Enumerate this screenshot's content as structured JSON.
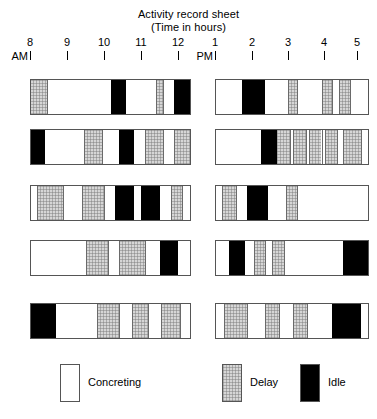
{
  "title": {
    "line1": "Activity record sheet",
    "line2": "(Time in hours)"
  },
  "axis": {
    "am_label": "AM",
    "pm_label": "PM",
    "am_ticks": [
      "8",
      "9",
      "10",
      "11",
      "12"
    ],
    "pm_ticks": [
      "1",
      "2",
      "3",
      "4",
      "5"
    ]
  },
  "legend": {
    "items": [
      {
        "label": "Concreting",
        "kind": "concreting",
        "color": "#ffffff"
      },
      {
        "label": "Delay",
        "kind": "delay",
        "color": "#d6d6d6"
      },
      {
        "label": "Idle",
        "kind": "idle",
        "color": "#000000"
      }
    ]
  },
  "chart_data": {
    "type": "bar",
    "title": "Activity record sheet",
    "subtitle": "(Time in hours)",
    "xlabel": "Time in hours",
    "ylabel": "",
    "grid": false,
    "legend_position": "bottom",
    "categories": [
      "Row 1",
      "Row 2",
      "Row 3",
      "Row 4",
      "Row 5"
    ],
    "activity_types": [
      "Concreting",
      "Delay",
      "Idle"
    ],
    "am_range": [
      8,
      12
    ],
    "pm_range": [
      13,
      17
    ],
    "am_tick_labels": [
      "8",
      "9",
      "10",
      "11",
      "12"
    ],
    "pm_tick_labels": [
      "1",
      "2",
      "3",
      "4",
      "5"
    ],
    "rows": [
      {
        "row": 1,
        "am": [
          {
            "activity": "Delay",
            "start": 8.0,
            "end": 8.45
          },
          {
            "activity": "Concreting",
            "start": 8.45,
            "end": 10.2
          },
          {
            "activity": "Idle",
            "start": 10.2,
            "end": 10.6
          },
          {
            "activity": "Concreting",
            "start": 10.6,
            "end": 11.4
          },
          {
            "activity": "Delay",
            "start": 11.4,
            "end": 11.6
          },
          {
            "activity": "Concreting",
            "start": 11.6,
            "end": 11.9
          },
          {
            "activity": "Idle",
            "start": 11.9,
            "end": 12.35
          }
        ],
        "pm": [
          {
            "activity": "Concreting",
            "start": 13.0,
            "end": 13.75
          },
          {
            "activity": "Idle",
            "start": 13.75,
            "end": 14.4
          },
          {
            "activity": "Concreting",
            "start": 14.4,
            "end": 15.05
          },
          {
            "activity": "Delay",
            "start": 15.05,
            "end": 15.3
          },
          {
            "activity": "Concreting",
            "start": 15.3,
            "end": 16.0
          },
          {
            "activity": "Delay",
            "start": 16.0,
            "end": 16.3
          },
          {
            "activity": "Concreting",
            "start": 16.3,
            "end": 16.5
          },
          {
            "activity": "Delay",
            "start": 16.5,
            "end": 16.8
          },
          {
            "activity": "Concreting",
            "start": 16.8,
            "end": 17.35
          }
        ]
      },
      {
        "row": 2,
        "am": [
          {
            "activity": "Idle",
            "start": 8.0,
            "end": 8.4
          },
          {
            "activity": "Concreting",
            "start": 8.4,
            "end": 9.45
          },
          {
            "activity": "Delay",
            "start": 9.45,
            "end": 9.95
          },
          {
            "activity": "Concreting",
            "start": 9.95,
            "end": 10.4
          },
          {
            "activity": "Idle",
            "start": 10.4,
            "end": 10.8
          },
          {
            "activity": "Concreting",
            "start": 10.8,
            "end": 11.1
          },
          {
            "activity": "Delay",
            "start": 11.1,
            "end": 11.6
          },
          {
            "activity": "Concreting",
            "start": 11.6,
            "end": 11.9
          },
          {
            "activity": "Delay",
            "start": 11.9,
            "end": 12.35
          }
        ],
        "pm": [
          {
            "activity": "Concreting",
            "start": 13.0,
            "end": 14.3
          },
          {
            "activity": "Idle",
            "start": 14.3,
            "end": 14.75
          },
          {
            "activity": "Delay",
            "start": 14.75,
            "end": 15.1
          },
          {
            "activity": "Concreting",
            "start": 15.1,
            "end": 15.2
          },
          {
            "activity": "Delay",
            "start": 15.2,
            "end": 15.55
          },
          {
            "activity": "Concreting",
            "start": 15.55,
            "end": 15.65
          },
          {
            "activity": "Delay",
            "start": 15.65,
            "end": 16.0
          },
          {
            "activity": "Concreting",
            "start": 16.0,
            "end": 16.1
          },
          {
            "activity": "Delay",
            "start": 16.1,
            "end": 16.45
          },
          {
            "activity": "Concreting",
            "start": 16.45,
            "end": 16.6
          },
          {
            "activity": "Delay",
            "start": 16.6,
            "end": 17.1
          },
          {
            "activity": "Concreting",
            "start": 17.1,
            "end": 17.35
          }
        ]
      },
      {
        "row": 3,
        "am": [
          {
            "activity": "Concreting",
            "start": 8.0,
            "end": 8.2
          },
          {
            "activity": "Delay",
            "start": 8.2,
            "end": 8.9
          },
          {
            "activity": "Concreting",
            "start": 8.9,
            "end": 9.4
          },
          {
            "activity": "Delay",
            "start": 9.4,
            "end": 10.0
          },
          {
            "activity": "Concreting",
            "start": 10.0,
            "end": 10.3
          },
          {
            "activity": "Idle",
            "start": 10.3,
            "end": 10.8
          },
          {
            "activity": "Concreting",
            "start": 10.8,
            "end": 11.0
          },
          {
            "activity": "Idle",
            "start": 11.0,
            "end": 11.5
          },
          {
            "activity": "Concreting",
            "start": 11.5,
            "end": 11.8
          },
          {
            "activity": "Delay",
            "start": 11.8,
            "end": 12.1
          },
          {
            "activity": "Concreting",
            "start": 12.1,
            "end": 12.35
          }
        ],
        "pm": [
          {
            "activity": "Concreting",
            "start": 13.0,
            "end": 13.2
          },
          {
            "activity": "Delay",
            "start": 13.2,
            "end": 13.6
          },
          {
            "activity": "Concreting",
            "start": 13.6,
            "end": 13.9
          },
          {
            "activity": "Idle",
            "start": 13.9,
            "end": 14.5
          },
          {
            "activity": "Concreting",
            "start": 14.5,
            "end": 15.0
          },
          {
            "activity": "Delay",
            "start": 15.0,
            "end": 15.3
          },
          {
            "activity": "Concreting",
            "start": 15.3,
            "end": 17.35
          }
        ]
      },
      {
        "row": 4,
        "am": [
          {
            "activity": "Concreting",
            "start": 8.0,
            "end": 9.5
          },
          {
            "activity": "Delay",
            "start": 9.5,
            "end": 10.1
          },
          {
            "activity": "Concreting",
            "start": 10.1,
            "end": 10.4
          },
          {
            "activity": "Delay",
            "start": 10.4,
            "end": 11.1
          },
          {
            "activity": "Concreting",
            "start": 11.1,
            "end": 11.5
          },
          {
            "activity": "Idle",
            "start": 11.5,
            "end": 12.0
          },
          {
            "activity": "Concreting",
            "start": 12.0,
            "end": 12.35
          }
        ],
        "pm": [
          {
            "activity": "Concreting",
            "start": 13.0,
            "end": 13.4
          },
          {
            "activity": "Idle",
            "start": 13.4,
            "end": 13.85
          },
          {
            "activity": "Concreting",
            "start": 13.85,
            "end": 14.1
          },
          {
            "activity": "Delay",
            "start": 14.1,
            "end": 14.4
          },
          {
            "activity": "Concreting",
            "start": 14.4,
            "end": 14.6
          },
          {
            "activity": "Delay",
            "start": 14.6,
            "end": 14.95
          },
          {
            "activity": "Concreting",
            "start": 14.95,
            "end": 16.6
          },
          {
            "activity": "Idle",
            "start": 16.6,
            "end": 17.35
          }
        ]
      },
      {
        "row": 5,
        "am": [
          {
            "activity": "Idle",
            "start": 8.0,
            "end": 8.7
          },
          {
            "activity": "Concreting",
            "start": 8.7,
            "end": 9.8
          },
          {
            "activity": "Delay",
            "start": 9.8,
            "end": 10.4
          },
          {
            "activity": "Concreting",
            "start": 10.4,
            "end": 10.75
          },
          {
            "activity": "Delay",
            "start": 10.75,
            "end": 11.2
          },
          {
            "activity": "Concreting",
            "start": 11.2,
            "end": 11.55
          },
          {
            "activity": "Delay",
            "start": 11.55,
            "end": 12.05
          },
          {
            "activity": "Concreting",
            "start": 12.05,
            "end": 12.35
          }
        ],
        "pm": [
          {
            "activity": "Concreting",
            "start": 13.0,
            "end": 13.25
          },
          {
            "activity": "Delay",
            "start": 13.25,
            "end": 13.9
          },
          {
            "activity": "Concreting",
            "start": 13.9,
            "end": 14.4
          },
          {
            "activity": "Delay",
            "start": 14.4,
            "end": 14.8
          },
          {
            "activity": "Concreting",
            "start": 14.8,
            "end": 15.2
          },
          {
            "activity": "Delay",
            "start": 15.2,
            "end": 15.6
          },
          {
            "activity": "Concreting",
            "start": 15.6,
            "end": 16.3
          },
          {
            "activity": "Idle",
            "start": 16.3,
            "end": 17.1
          },
          {
            "activity": "Concreting",
            "start": 17.1,
            "end": 17.35
          }
        ]
      }
    ]
  },
  "layout": {
    "am_bar_left": 28,
    "am_bar_right": 186,
    "pm_bar_left": 213,
    "pm_bar_right": 359,
    "row_tops": [
      79,
      129,
      185,
      240,
      303
    ],
    "row_height": 36,
    "am_tick_x": [
      30,
      67,
      104,
      141,
      178
    ],
    "pm_tick_x": [
      215,
      252,
      288,
      324,
      357
    ],
    "legend_x": [
      60,
      222,
      300
    ]
  }
}
